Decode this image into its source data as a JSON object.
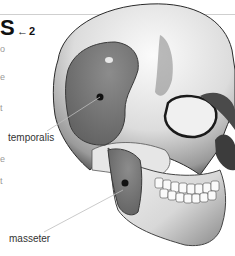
{
  "header": {
    "title_fragment": "S",
    "reference_arrow": "←",
    "reference_number": "2"
  },
  "left_text_fragments": [
    "o",
    "e",
    "t",
    "e",
    "t",
    "e"
  ],
  "diagram": {
    "labels": [
      {
        "id": "temporalis",
        "text": "temporalis"
      },
      {
        "id": "masseter",
        "text": "masseter"
      }
    ],
    "colors": {
      "bone_light": "#f2f2f2",
      "bone_shadow": "#6a6a6a",
      "muscle": "#7a7a7a",
      "muscle_dark": "#5e5e5e",
      "marker": "#111111",
      "leader_line": "#bdbdbd",
      "rule": "#cfcfcf"
    }
  }
}
